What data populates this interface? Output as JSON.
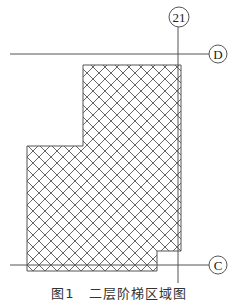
{
  "figure": {
    "caption": "图1　二层阶梯区域图",
    "colors": {
      "line": "#555555",
      "hatch": "#555555",
      "background": "#ffffff"
    },
    "axes": {
      "vertical": [
        {
          "label": "21",
          "x": 178,
          "y1": 27,
          "y2": 283,
          "bubble_cx": 179,
          "bubble_cy": 17,
          "bubble_r": 10
        }
      ],
      "horizontal": [
        {
          "label": "D",
          "y": 54,
          "x1": 10,
          "x2": 209,
          "bubble_cx": 218,
          "bubble_cy": 54,
          "bubble_r": 9
        },
        {
          "label": "C",
          "y": 265,
          "x1": 10,
          "x2": 209,
          "bubble_cx": 218,
          "bubble_cy": 265,
          "bubble_r": 9
        }
      ]
    },
    "hatched_region": {
      "pattern": "crosshatch-diagonal",
      "spacing": 12,
      "outline": [
        [
          83,
          65
        ],
        [
          181,
          65
        ],
        [
          181,
          251
        ],
        [
          157,
          251
        ],
        [
          157,
          271
        ],
        [
          27,
          271
        ],
        [
          27,
          146
        ],
        [
          83,
          146
        ]
      ]
    }
  }
}
